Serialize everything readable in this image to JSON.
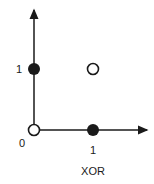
{
  "diagram": {
    "title": "XOR",
    "axes": {
      "x_tick_labels": {
        "origin": "0",
        "one": "1"
      },
      "y_tick_labels": {
        "one": "1"
      }
    },
    "points": [
      {
        "x": 0,
        "y": 0,
        "style": "open"
      },
      {
        "x": 1,
        "y": 0,
        "style": "filled"
      },
      {
        "x": 0,
        "y": 1,
        "style": "filled"
      },
      {
        "x": 1,
        "y": 1,
        "style": "open"
      }
    ],
    "colors": {
      "ink": "#1a1a1a",
      "background": "#ffffff"
    }
  }
}
